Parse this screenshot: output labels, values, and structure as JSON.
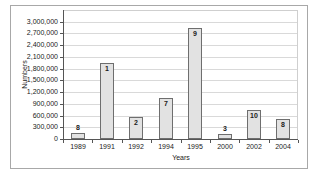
{
  "chart_data": {
    "type": "bar",
    "title": "",
    "xlabel": "Years",
    "ylabel": "Numbers",
    "categories": [
      "1989",
      "1991",
      "1992",
      "1994",
      "1995",
      "2000",
      "2002",
      "2004"
    ],
    "values": [
      150000,
      1950000,
      550000,
      1050000,
      2850000,
      130000,
      750000,
      500000
    ],
    "bar_value_labels": [
      "8",
      "1",
      "2",
      "7",
      "9",
      "3",
      "10",
      "8"
    ],
    "ylim": [
      0,
      3000000
    ],
    "ytick_step": 300000,
    "ytick_labels": [
      "0",
      "300,000",
      "600,000",
      "900,000",
      "1,200,000",
      "1,500,000",
      "1,800,000",
      "2,100,000",
      "2,400,000",
      "2,700,000",
      "3,000,000"
    ],
    "grid": true,
    "legend": "none",
    "colors": {
      "bar_fill": "#e2e2e2",
      "bar_border": "#6e6e6e",
      "grid": "#d9d9d9",
      "axis": "#555555",
      "plot_outline": "#cfcfcf",
      "frame_border": "#a8a8a8",
      "text": "#1a1a1a",
      "background": "#ffffff"
    }
  }
}
